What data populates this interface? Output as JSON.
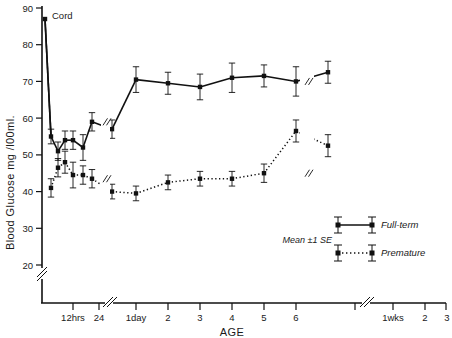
{
  "chart_data": {
    "type": "line",
    "title": "",
    "xlabel": "AGE",
    "ylabel": "Blood Glucose mg /l00ml.",
    "ylim": [
      15,
      90
    ],
    "yticks": [
      20,
      30,
      40,
      50,
      60,
      70,
      80,
      90
    ],
    "ytick_labels": [
      "20",
      "30",
      "40",
      "50",
      "60",
      "70",
      "80",
      "90"
    ],
    "y_axis_break": true,
    "grid": false,
    "legend_position": "lower-right",
    "legend_note": "Mean ±1 SE",
    "annotations": [
      {
        "text": "Cord",
        "x_category": "cord",
        "y": 87
      }
    ],
    "x_categories": [
      "cord",
      "0",
      "2hrs",
      "4hrs",
      "6hrs",
      "9hrs",
      "12hrs",
      "24",
      "1day",
      "2",
      "3",
      "4",
      "5",
      "6",
      "1wks",
      "2",
      "3"
    ],
    "xtick_labels": [
      "12hrs",
      "24",
      "1day",
      "2",
      "3",
      "4",
      "5",
      "6",
      "1wks",
      "2",
      "3"
    ],
    "x_axis_breaks": [
      "after 24",
      "after 6"
    ],
    "series": [
      {
        "name": "Full-term",
        "style": "solid",
        "marker": "square",
        "color": "#111111",
        "points": [
          {
            "x": "cord",
            "y": 87,
            "se": 0
          },
          {
            "x": "1hr",
            "y": 55,
            "se": 2.0
          },
          {
            "x": "2hrs",
            "y": 51,
            "se": 2.5
          },
          {
            "x": "4hrs",
            "y": 54,
            "se": 2.5
          },
          {
            "x": "6hrs",
            "y": 54,
            "se": 2.5
          },
          {
            "x": "9hrs",
            "y": 52,
            "se": 3.5
          },
          {
            "x": "12hrs",
            "y": 59,
            "se": 2.5
          },
          {
            "x": "24",
            "y": 57,
            "se": 2.5
          },
          {
            "x": "1day",
            "y": 70.5,
            "se": 3.5
          },
          {
            "x": "2",
            "y": 69.5,
            "se": 3.0
          },
          {
            "x": "3",
            "y": 68.5,
            "se": 3.5
          },
          {
            "x": "4",
            "y": 71,
            "se": 4.0
          },
          {
            "x": "5",
            "y": 71.5,
            "se": 3.0
          },
          {
            "x": "6",
            "y": 70,
            "se": 4.0
          },
          {
            "x": "1wks",
            "y": 72.5,
            "se": 3.0
          }
        ]
      },
      {
        "name": "Premature",
        "style": "dotted",
        "marker": "square",
        "color": "#111111",
        "points": [
          {
            "x": "1hr",
            "y": 41,
            "se": 2.5
          },
          {
            "x": "2hrs",
            "y": 46.5,
            "se": 2.5
          },
          {
            "x": "4hrs",
            "y": 48,
            "se": 3.0
          },
          {
            "x": "6hrs",
            "y": 44.5,
            "se": 3.5
          },
          {
            "x": "9hrs",
            "y": 44.5,
            "se": 2.5
          },
          {
            "x": "12hrs",
            "y": 43.5,
            "se": 2.5
          },
          {
            "x": "24",
            "y": 40,
            "se": 2.0
          },
          {
            "x": "1day",
            "y": 39.5,
            "se": 2.0
          },
          {
            "x": "2",
            "y": 42.5,
            "se": 2.0
          },
          {
            "x": "3",
            "y": 43.5,
            "se": 2.0
          },
          {
            "x": "4",
            "y": 43.5,
            "se": 2.0
          },
          {
            "x": "5",
            "y": 45,
            "se": 2.5
          },
          {
            "x": "6",
            "y": 56.5,
            "se": 3.0
          },
          {
            "x": "1wks",
            "y": 52.5,
            "se": 3.0
          }
        ]
      }
    ]
  },
  "legend": {
    "note": "Mean ±1 SE",
    "entries": [
      {
        "label": "Full-term",
        "style": "solid"
      },
      {
        "label": "Premature",
        "style": "dotted"
      }
    ]
  },
  "axes": {
    "y_title": "Blood Glucose mg /l00ml.",
    "x_title": "AGE",
    "y_ticks": [
      "90",
      "80",
      "70",
      "60",
      "50",
      "40",
      "30",
      "20"
    ],
    "x_ticks": [
      "12hrs",
      "24",
      "1day",
      "2",
      "3",
      "4",
      "5",
      "6",
      "1wks",
      "2",
      "3"
    ]
  },
  "annotation_cord": "Cord"
}
